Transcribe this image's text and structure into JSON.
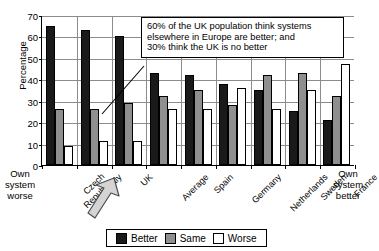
{
  "chart_data": {
    "type": "bar",
    "title": "",
    "xlabel": "",
    "ylabel": "Percentage",
    "ylim": [
      0,
      70
    ],
    "ytick_step": 10,
    "yticks": [
      0,
      10,
      20,
      30,
      40,
      50,
      60,
      70
    ],
    "grid": true,
    "legend_position": "bottom",
    "categories": [
      "Czech Republic",
      "Italy",
      "UK",
      "Average",
      "Spain",
      "Germany",
      "Netherlands",
      "Sweden",
      "France"
    ],
    "series": [
      {
        "name": "Better",
        "color": "#1a1a1a",
        "values": [
          65,
          63,
          60,
          43,
          42,
          38,
          35,
          25,
          21
        ]
      },
      {
        "name": "Same",
        "color": "#8f8f8f",
        "values": [
          26,
          26,
          29,
          32,
          35,
          28,
          42,
          43,
          32
        ]
      },
      {
        "name": "Worse",
        "color": "#ffffff",
        "values": [
          9,
          11,
          11,
          26,
          26,
          36,
          26,
          35,
          47
        ]
      }
    ],
    "annotations": [
      "60% of the UK population think systems elsewhere in Europe are better; and 30% think the UK is no better"
    ],
    "axis_notes": {
      "left": "Own system worse",
      "right": "Own system better"
    }
  },
  "callout": {
    "line1": "60% of the UK population think systems",
    "line2": "elsewhere in Europe are better; and",
    "line3": "30% think the UK is no better"
  },
  "side_labels": {
    "left": {
      "l1": "Own",
      "l2": "system",
      "l3": "worse"
    },
    "right": {
      "l1": "Own",
      "l2": "system",
      "l3": "better"
    }
  },
  "legend": {
    "items": [
      {
        "label": "Better"
      },
      {
        "label": "Same"
      },
      {
        "label": "Worse"
      }
    ]
  },
  "highlight": {
    "arrow_target": "UK"
  }
}
